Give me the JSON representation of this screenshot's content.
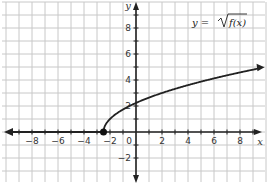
{
  "chart_data": {
    "type": "line",
    "title_parts": {
      "lhs": "y = ",
      "radicand": "f(x)"
    },
    "xlabel": "x",
    "ylabel": "y",
    "xlim": [
      -10,
      10
    ],
    "ylim": [
      -3,
      10
    ],
    "grid": true,
    "x_ticks": [
      -8,
      -6,
      -4,
      -2,
      0,
      2,
      4,
      6,
      8
    ],
    "y_ticks": [
      -2,
      2,
      4,
      6,
      8
    ],
    "series": [
      {
        "name": "y = √f(x)",
        "note": "ray along x-axis from x=-2.5 to the left (y=0), then curve rising from (-2.5,0)",
        "x": [
          -10,
          -2.5,
          -2,
          -1,
          0,
          2,
          4,
          6,
          8,
          9.5
        ],
        "values": [
          0,
          0,
          1.0,
          1.7,
          2.2,
          3.0,
          3.6,
          4.1,
          4.6,
          4.9
        ]
      }
    ],
    "points": [
      {
        "x": -2.5,
        "y": 0,
        "style": "closed-dot"
      }
    ]
  }
}
